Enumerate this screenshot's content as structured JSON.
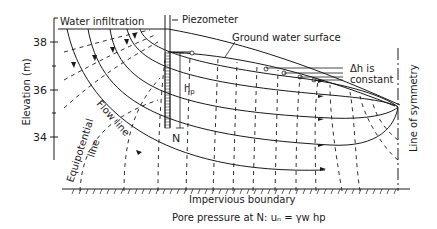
{
  "figure": {
    "labels": {
      "water_infiltration": "Water infiltration",
      "piezometer": "Piezometer",
      "ground_water_surface": "Ground water surface",
      "delta_h": "Δh is",
      "constant": "constant",
      "hp": "h",
      "hp_sub": "p",
      "flow_line": "Flow line",
      "equipotential_line_1": "Equipotential",
      "equipotential_line_2": "line",
      "point_n": "N",
      "line_of_symmetry": "Line of symmetry",
      "impervious_boundary": "Impervious boundary",
      "caption": "Pore pressure at N: uₙ = γw hp"
    },
    "axis": {
      "ylabel": "Elevation (m)",
      "ticks": [
        "38",
        "36",
        "34"
      ]
    }
  }
}
